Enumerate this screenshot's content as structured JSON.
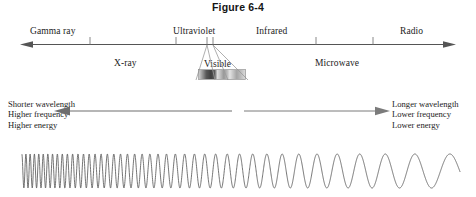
{
  "figure": {
    "title": "Figure 6-4"
  },
  "spectrum_axis": {
    "arrow_style": "double-headed",
    "line_color": "#4a4a4a",
    "bands_above": [
      {
        "label": "Gamma ray",
        "x": 60
      },
      {
        "label": "Ultraviolet",
        "x": 208
      },
      {
        "label": "Infrared",
        "x": 281
      },
      {
        "label": "Radio",
        "x": 415
      }
    ],
    "bands_below": [
      {
        "label": "X-ray",
        "x": 130
      },
      {
        "label": "Microwave",
        "x": 344
      }
    ],
    "ticks": [
      90,
      176,
      207,
      212,
      316,
      373
    ]
  },
  "visible_callout": {
    "label": "Visible",
    "strip_colors": [
      "violet",
      "blue",
      "cyan",
      "green",
      "yellow",
      "orange",
      "red"
    ],
    "note": "grayscale-scanned color spectrum strip"
  },
  "direction_left": {
    "line1": "Shorter wavelength",
    "line2": "Higher frequency",
    "line3": "Higher energy",
    "arrow_direction": "left"
  },
  "direction_right": {
    "line1": "Longer wavelength",
    "line2": "Lower frequency",
    "line3": "Lower energy",
    "arrow_direction": "right"
  },
  "wave": {
    "description": "chirped sine wave, frequency decreasing left to right",
    "stroke_color": "#5c5c5c"
  },
  "chart_data": {
    "type": "line",
    "title": "Figure 6-4",
    "xlabel": "",
    "ylabel": "",
    "categories": [
      "Gamma ray",
      "X-ray",
      "Ultraviolet",
      "Visible",
      "Infrared",
      "Microwave",
      "Radio"
    ],
    "series": [
      {
        "name": "Electromagnetic spectrum bands (left = short wavelength, right = long wavelength)",
        "values": [
          1,
          2,
          3,
          4,
          5,
          6,
          7
        ]
      }
    ],
    "annotations": [
      "Shorter wavelength",
      "Higher frequency",
      "Higher energy",
      "Longer wavelength",
      "Lower frequency",
      "Lower energy"
    ],
    "grid": false,
    "legend_position": "none"
  }
}
